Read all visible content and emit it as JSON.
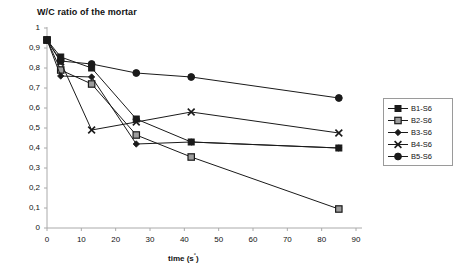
{
  "chart_data": {
    "type": "line",
    "title": "W/C ratio of the mortar",
    "xlabel": "time (s",
    "xlabel_sup": "°",
    "xlabel_close": ")",
    "ylabel": "",
    "xlim": [
      0,
      90
    ],
    "ylim": [
      0,
      1
    ],
    "grid": false,
    "legend_position": "right",
    "xticks": [
      "0",
      "10",
      "20",
      "30",
      "40",
      "50",
      "60",
      "70",
      "80",
      "90"
    ],
    "yticks": [
      "0",
      "0,1",
      "0,2",
      "0,3",
      "0,4",
      "0,5",
      "0,6",
      "0,7",
      "0,8",
      "0,9",
      "1"
    ],
    "x": [
      0,
      4,
      13,
      26,
      42,
      85
    ],
    "series": [
      {
        "name": "B1-S6",
        "marker": "filled-square",
        "color": "#1a1a1a",
        "values": [
          0.94,
          0.855,
          0.8,
          0.545,
          0.43,
          0.4
        ]
      },
      {
        "name": "B2-S6",
        "marker": "open-square",
        "color": "#1a1a1a",
        "values": [
          0.94,
          0.79,
          0.72,
          0.465,
          0.355,
          0.095
        ]
      },
      {
        "name": "B3-S6",
        "marker": "filled-diamond",
        "color": "#1a1a1a",
        "values": [
          0.94,
          0.76,
          0.755,
          0.42,
          0.43,
          0.4
        ]
      },
      {
        "name": "B4-S6",
        "marker": "cross",
        "color": "#1a1a1a",
        "values": [
          0.94,
          0.83,
          0.49,
          0.53,
          0.58,
          0.475
        ]
      },
      {
        "name": "B5-S6",
        "marker": "filled-circle",
        "color": "#1a1a1a",
        "values": [
          0.94,
          0.835,
          0.82,
          0.775,
          0.755,
          0.65
        ]
      }
    ]
  },
  "legend": {
    "items": [
      {
        "label": "B1-S6"
      },
      {
        "label": "B2-S6"
      },
      {
        "label": "B3-S6"
      },
      {
        "label": "B4-S6"
      },
      {
        "label": "B5-S6"
      }
    ]
  }
}
